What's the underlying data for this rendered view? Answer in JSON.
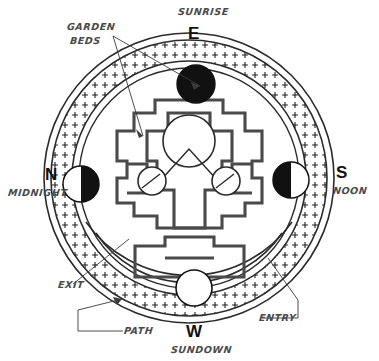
{
  "diagram": {
    "type": "garden-plan",
    "colors": {
      "line": "#3a3a3a",
      "dark_fill": "#111111",
      "label_text": "#4a4a4a",
      "cardinal_text": "#111111",
      "background": "#ffffff"
    }
  },
  "cardinals": [
    {
      "name": "east",
      "letter": "E",
      "meaning": "SUNRISE",
      "position": "top"
    },
    {
      "name": "south",
      "letter": "S",
      "meaning": "NOON",
      "position": "right"
    },
    {
      "name": "west",
      "letter": "W",
      "meaning": "SUNDOWN",
      "position": "bottom"
    },
    {
      "name": "north",
      "letter": "N",
      "meaning": "MIDNIGHT",
      "position": "left"
    }
  ],
  "annotations": [
    {
      "name": "garden-beds",
      "line1": "GARDEN",
      "line2": "BEDS",
      "leaders": 2
    },
    {
      "name": "exit",
      "text": "EXIT",
      "leaders": 1
    },
    {
      "name": "path",
      "text": "PATH",
      "leaders": 2
    },
    {
      "name": "entry",
      "text": "ENTRY",
      "leaders": 1
    }
  ],
  "moon_markers": [
    {
      "name": "new-moon-east",
      "position": "top",
      "fill": "full-black"
    },
    {
      "name": "half-moon-south",
      "position": "right",
      "fill": "left-half-black"
    },
    {
      "name": "full-moon-west",
      "position": "bottom",
      "fill": "empty"
    },
    {
      "name": "half-moon-north",
      "position": "left",
      "fill": "right-half-black"
    }
  ],
  "rings": {
    "outer_circle_r": 145,
    "path_ring_outer_r": 138,
    "path_ring_inner_r": 117,
    "inner_circle_r": 110,
    "path_fill": "stipple-cross-hatch"
  },
  "center_features": [
    {
      "name": "central-circle",
      "r": 26
    },
    {
      "name": "west-small-circle",
      "r": 14
    },
    {
      "name": "east-small-circle",
      "r": 14
    },
    {
      "name": "chevron",
      "shape": "v-apex"
    }
  ]
}
